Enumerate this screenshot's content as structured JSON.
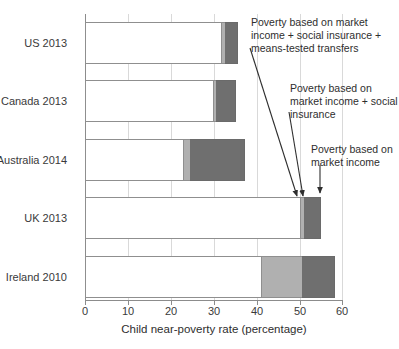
{
  "chart_data": {
    "type": "bar",
    "orientation": "horizontal",
    "stacked": true,
    "title": "",
    "xlabel": "Child near-poverty rate (percentage)",
    "ylabel": "",
    "xlim": [
      0,
      60
    ],
    "xticks": [
      0,
      10,
      20,
      30,
      40,
      50,
      60
    ],
    "xtick_labels": [
      "0",
      "10",
      "20",
      "30",
      "40",
      "50",
      "60"
    ],
    "grid": true,
    "legend": "none",
    "categories": [
      "US 2013",
      "Canada 2013",
      "Australia 2014",
      "UK 2013",
      "Ireland 2010"
    ],
    "series": [
      {
        "name": "Poverty based on market income + social insurance + means-tested transfers",
        "color": "#ffffff",
        "values": [
          32.0,
          30.0,
          23.0,
          50.5,
          41.4
        ]
      },
      {
        "name": "Poverty based on market income + social insurance",
        "color": "#b0b0b0",
        "values": [
          32.6,
          30.6,
          24.6,
          51.2,
          50.7
        ]
      },
      {
        "name": "Poverty based on market income",
        "color": "#6f6f6f",
        "values": [
          35.8,
          35.3,
          37.4,
          55.0,
          58.4
        ]
      }
    ],
    "annotations": [
      {
        "id": "annotation-means-tested",
        "text": "Poverty based on market income + social insurance + means-tested transfers",
        "points_to": "US 2013 white segment edge"
      },
      {
        "id": "annotation-social-insurance",
        "text": "Poverty based on market income + social insurance",
        "points_to": "UK 2013 mid segment edge"
      },
      {
        "id": "annotation-market-income",
        "text": "Poverty based on market income",
        "points_to": "UK 2013 dark segment edge"
      }
    ]
  },
  "axis": {
    "x_title": "Child near-poverty rate (percentage)",
    "ticks": [
      "0",
      "10",
      "20",
      "30",
      "40",
      "50",
      "60"
    ]
  },
  "categories": {
    "c0": "US 2013",
    "c1": "Canada 2013",
    "c2": "Australia 2014",
    "c3": "UK 2013",
    "c4": "Ireland 2010"
  },
  "annotations": {
    "a1": "Poverty based on market income + social insurance + means-tested transfers",
    "a2": "Poverty based on market income + social insurance",
    "a3": "Poverty based on market income"
  }
}
